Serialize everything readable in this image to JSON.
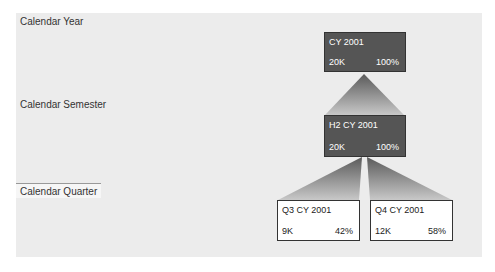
{
  "levels": [
    {
      "label": "Calendar Year",
      "selected": false
    },
    {
      "label": "Calendar Semester",
      "selected": false
    },
    {
      "label": "Calendar Quarter",
      "selected": true
    }
  ],
  "nodes": {
    "year": {
      "title": "CY 2001",
      "value": "20K",
      "percent": "100%"
    },
    "semester": {
      "title": "H2 CY 2001",
      "value": "20K",
      "percent": "100%"
    },
    "q3": {
      "title": "Q3 CY 2001",
      "value": "9K",
      "percent": "42%"
    },
    "q4": {
      "title": "Q4 CY 2001",
      "value": "12K",
      "percent": "58%"
    }
  },
  "colors": {
    "panel_bg": "#ececec",
    "dark_node": "#555555",
    "light_node": "#ffffff",
    "connector": "#6a6a6a"
  }
}
